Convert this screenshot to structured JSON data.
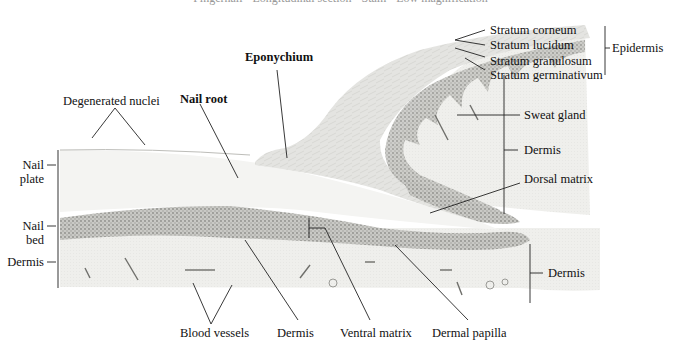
{
  "figure": {
    "title": "Fingernail · Longitudinal section · Stain · Low magnification",
    "type": "histology-illustration"
  },
  "labels": {
    "top": {
      "degenerated_nuclei": "Degenerated nuclei",
      "nail_root": "Nail root",
      "eponychium": "Eponychium"
    },
    "epidermis_layers": [
      "Stratum corneum",
      "Stratum lucidum",
      "Stratum granulosum",
      "Stratum germinativum"
    ],
    "epidermis_group": "Epidermis",
    "right": {
      "sweat_gland": "Sweat gland",
      "dermis_upper": "Dermis",
      "dorsal_matrix": "Dorsal matrix",
      "dermis_lower": "Dermis"
    },
    "left": {
      "nail_plate": "Nail\nplate",
      "nail_plate_line1": "Nail",
      "nail_plate_line2": "plate",
      "nail_bed_line1": "Nail",
      "nail_bed_line2": "bed",
      "dermis": "Dermis"
    },
    "bottom": {
      "blood_vessels": "Blood vessels",
      "dermis": "Dermis",
      "ventral_matrix": "Ventral matrix",
      "dermal_papilla": "Dermal papilla"
    }
  },
  "colors": {
    "background": "#ffffff",
    "tissue_light": "#f1f1ef",
    "tissue_mid": "#d9d9d6",
    "cell_dense": "#9a9a96",
    "leader_line": "#222222"
  }
}
